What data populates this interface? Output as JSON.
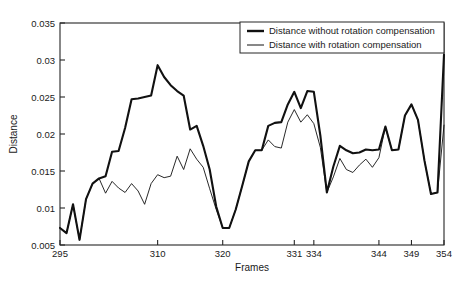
{
  "chart_data": {
    "type": "line",
    "title": "",
    "xlabel": "Frames",
    "ylabel": "Distance",
    "xlim": [
      295,
      354
    ],
    "ylim": [
      0.005,
      0.035
    ],
    "grid": false,
    "legend_position": "top-right",
    "xticks": [
      295,
      310,
      320,
      331,
      334,
      344,
      349,
      354
    ],
    "xtick_labels": [
      "295",
      "310",
      "320",
      "331",
      "334",
      "344",
      "349",
      "354"
    ],
    "yticks": [
      0.005,
      0.01,
      0.015,
      0.02,
      0.025,
      0.03,
      0.035
    ],
    "ytick_labels": [
      "0.005",
      "0.01",
      "0.015",
      "0.02",
      "0.025",
      "0.03",
      "0.035"
    ],
    "x": [
      295,
      296,
      297,
      298,
      299,
      300,
      301,
      302,
      303,
      304,
      305,
      306,
      307,
      308,
      309,
      310,
      311,
      312,
      313,
      314,
      315,
      316,
      317,
      318,
      319,
      320,
      321,
      322,
      323,
      324,
      325,
      326,
      327,
      328,
      329,
      330,
      331,
      332,
      333,
      334,
      335,
      336,
      337,
      338,
      339,
      340,
      341,
      342,
      343,
      344,
      345,
      346,
      347,
      348,
      349,
      350,
      351,
      352,
      353,
      354
    ],
    "series": [
      {
        "name": "Distance without rotation compensation",
        "line_width": "thick",
        "color": "#111111",
        "values": [
          0.0073,
          0.0066,
          0.0105,
          0.0057,
          0.0112,
          0.0133,
          0.014,
          0.0143,
          0.0176,
          0.0177,
          0.0208,
          0.0247,
          0.0248,
          0.025,
          0.0252,
          0.0293,
          0.0277,
          0.0266,
          0.0258,
          0.0252,
          0.0206,
          0.0211,
          0.0184,
          0.0152,
          0.0102,
          0.0073,
          0.0073,
          0.0098,
          0.013,
          0.0163,
          0.0178,
          0.0178,
          0.0211,
          0.0215,
          0.0216,
          0.024,
          0.0257,
          0.0235,
          0.0258,
          0.0257,
          0.0198,
          0.0121,
          0.0156,
          0.0184,
          0.0178,
          0.0174,
          0.0175,
          0.0179,
          0.0178,
          0.0179,
          0.021,
          0.0178,
          0.0179,
          0.0225,
          0.024,
          0.0219,
          0.0164,
          0.0119,
          0.0121,
          0.0307
        ]
      },
      {
        "name": "Distance with rotation compensation",
        "line_width": "thin",
        "color": "#111111",
        "values": [
          0.0073,
          0.0066,
          0.0105,
          0.0057,
          0.0112,
          0.0133,
          0.014,
          0.012,
          0.0136,
          0.0127,
          0.0121,
          0.0133,
          0.0123,
          0.0105,
          0.0133,
          0.0145,
          0.0141,
          0.0143,
          0.017,
          0.0152,
          0.018,
          0.0166,
          0.0155,
          0.0126,
          0.0098,
          0.0073,
          0.0073,
          0.0098,
          0.013,
          0.0163,
          0.0178,
          0.0178,
          0.0192,
          0.0183,
          0.0181,
          0.0216,
          0.0233,
          0.0216,
          0.0226,
          0.0214,
          0.0182,
          0.0121,
          0.0142,
          0.0167,
          0.0152,
          0.0148,
          0.0158,
          0.0166,
          0.0155,
          0.0168,
          0.021,
          0.0178,
          0.0179,
          0.0225,
          0.024,
          0.0219,
          0.0164,
          0.0119,
          0.0121,
          0.0212
        ]
      }
    ]
  },
  "legend": {
    "items": [
      {
        "label": "Distance without rotation compensation",
        "style": "thick"
      },
      {
        "label": "Distance with rotation compensation",
        "style": "thin"
      }
    ]
  }
}
